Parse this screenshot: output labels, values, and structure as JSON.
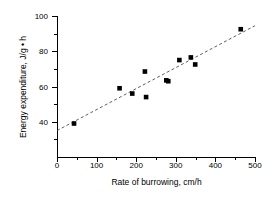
{
  "chart_data": {
    "type": "scatter",
    "title": "",
    "xlabel": "Rate of burrowing, cm/h",
    "ylabel": "Energy expenditure, J/g • h",
    "xlim": [
      0,
      500
    ],
    "ylim": [
      20,
      100
    ],
    "grid": false,
    "legend": null,
    "x_ticks": [
      0,
      100,
      200,
      300,
      400,
      500
    ],
    "x_tick_labels": [
      "0",
      "100",
      "200",
      "300",
      "400",
      "500"
    ],
    "x_minor_ticks": [
      50,
      150,
      250,
      350,
      450
    ],
    "y_ticks": [
      40,
      60,
      80,
      100
    ],
    "y_tick_labels": [
      "40",
      "60",
      "80",
      "100"
    ],
    "y_minor_ticks": [
      30,
      50,
      70,
      90
    ],
    "marker": "filled-square",
    "marker_color": "#000000",
    "points": [
      {
        "x": 43,
        "y": 39.0
      },
      {
        "x": 158,
        "y": 59.0
      },
      {
        "x": 190,
        "y": 56.0
      },
      {
        "x": 222,
        "y": 68.5
      },
      {
        "x": 225,
        "y": 54.0
      },
      {
        "x": 276,
        "y": 63.5
      },
      {
        "x": 281,
        "y": 63.0
      },
      {
        "x": 309,
        "y": 75.0
      },
      {
        "x": 338,
        "y": 76.5
      },
      {
        "x": 349,
        "y": 72.5
      },
      {
        "x": 464,
        "y": 92.5
      }
    ],
    "trend_line": {
      "style": "dashed",
      "color": "#4d4d4d",
      "x_start": 0,
      "y_start": 35.0,
      "x_end": 500,
      "y_end": 94.5
    }
  }
}
